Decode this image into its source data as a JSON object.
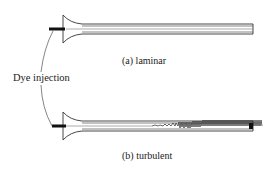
{
  "diagram": {
    "callout_label": "Dye injection",
    "panels": [
      {
        "id": "a",
        "tag": "(a)",
        "label": "laminar",
        "caption": "(a)  laminar"
      },
      {
        "id": "b",
        "tag": "(b)",
        "label": "turbulent",
        "caption": "(b)  turbulent"
      }
    ],
    "colors": {
      "ink": "#222222",
      "background": "#ffffff"
    }
  }
}
